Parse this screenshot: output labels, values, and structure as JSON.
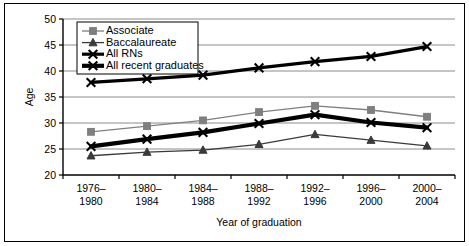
{
  "chart_data": {
    "type": "line",
    "title": "",
    "xlabel": "Year of graduation",
    "ylabel": "Age",
    "categories": [
      "1976–1980",
      "1980–1984",
      "1984–1988",
      "1988–1992",
      "1992–1996",
      "1996–2000",
      "2000–2004"
    ],
    "categories_line1": [
      "1976–",
      "1980–",
      "1984–",
      "1988–",
      "1992–",
      "1996–",
      "2000–"
    ],
    "categories_line2": [
      "1980",
      "1984",
      "1988",
      "1992",
      "1996",
      "2000",
      "2004"
    ],
    "ylim": [
      20,
      50
    ],
    "yticks": [
      20,
      25,
      30,
      35,
      40,
      45,
      50
    ],
    "ytick_labels": [
      "20",
      "25",
      "30",
      "35",
      "40",
      "45",
      "50"
    ],
    "grid": true,
    "legend_position": "upper-left-inside",
    "series": [
      {
        "name": "Associate",
        "marker": "square",
        "color": "#7f7f7f",
        "line_width": 1.3,
        "values": [
          28.3,
          29.4,
          30.5,
          32.1,
          33.3,
          32.5,
          31.2
        ]
      },
      {
        "name": "Baccalaureate",
        "marker": "triangle",
        "color": "#3a3a3a",
        "line_width": 1.3,
        "values": [
          23.7,
          24.4,
          24.8,
          25.9,
          27.8,
          26.7,
          25.6
        ]
      },
      {
        "name": "All RNs",
        "marker": "x",
        "color": "#000000",
        "line_width": 3.2,
        "values": [
          37.8,
          38.5,
          39.2,
          40.6,
          41.8,
          42.8,
          44.7
        ]
      },
      {
        "name": "All recent graduates",
        "marker": "x",
        "color": "#000000",
        "line_width": 4.2,
        "values": [
          25.5,
          26.9,
          28.2,
          29.9,
          31.6,
          30.1,
          29.1
        ]
      }
    ]
  },
  "legend": {
    "items": [
      {
        "label": "Associate"
      },
      {
        "label": "Baccalaureate"
      },
      {
        "label": "All RNs"
      },
      {
        "label": "All recent graduates"
      }
    ]
  },
  "axes": {
    "y_title": "Age",
    "x_title": "Year of graduation"
  }
}
